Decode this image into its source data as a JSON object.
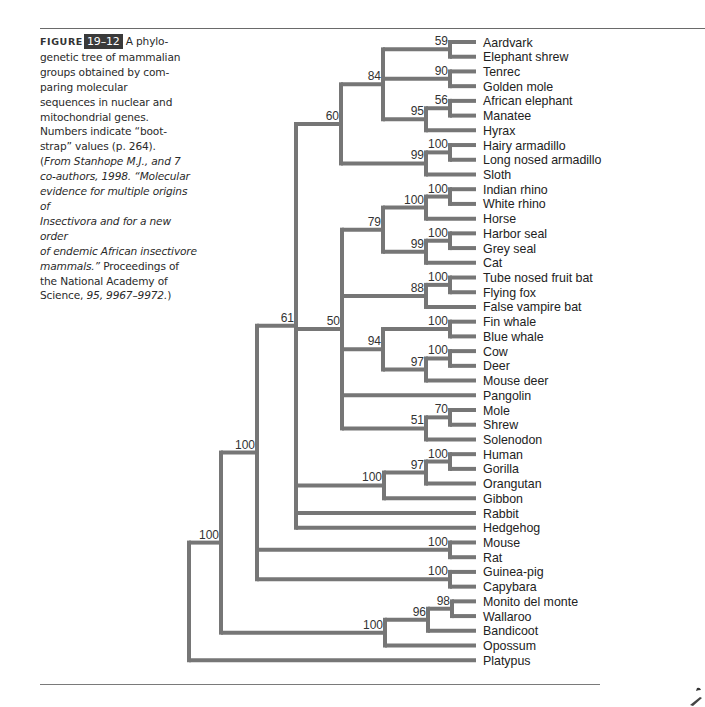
{
  "figure": {
    "label_word": "FIGURE",
    "number": "19–12",
    "caption_text": "A phylogenetic tree of mammalian groups obtained by comparing molecular sequences in nuclear and mitochondrial genes. Numbers indicate “bootstrap” values (p. 264).",
    "caption_lines": [
      "A phylo-",
      "genetic tree of mammalian",
      "groups obtained by com-",
      "paring molecular",
      "sequences in nuclear and",
      "mitochondrial genes.",
      "Numbers indicate “boot-",
      "strap” values (p. 264)."
    ],
    "source_open": "(",
    "source_italic_1": "From Stanhope M.J., and 7",
    "source_italic_2": "co-authors, 1998. “Molecular",
    "source_italic_3": "evidence for multiple origins of",
    "source_italic_4": "Insectivora and for a new order",
    "source_italic_5": "of endemic African insectivore",
    "source_italic_6": "mammals.”",
    "source_plain_1": " Proceedings of",
    "source_plain_2": "the National Academy of",
    "source_plain_3": "Science, ",
    "source_italic_7": "95, 9967–9972.",
    "source_close": ")"
  },
  "colors": {
    "branch": "#767676",
    "rule": "#6a6a6a",
    "figure_badge_bg": "#3a3a3a",
    "text": "#222222"
  },
  "chart_data": {
    "type": "tree",
    "values_meaning": "bootstrap support values",
    "layout": {
      "leaf_top_y": 42,
      "leaf_spacing": 14.72,
      "leaf_x": 476,
      "label_x": 483
    },
    "leaves": [
      "Aardvark",
      "Elephant shrew",
      "Tenrec",
      "Golden mole",
      "African elephant",
      "Manatee",
      "Hyrax",
      "Hairy armadillo",
      "Long nosed armadillo",
      "Sloth",
      "Indian rhino",
      "White rhino",
      "Horse",
      "Harbor seal",
      "Grey seal",
      "Cat",
      "Tube nosed fruit bat",
      "Flying fox",
      "False vampire bat",
      "Fin whale",
      "Blue whale",
      "Cow",
      "Deer",
      "Mouse deer",
      "Pangolin",
      "Mole",
      "Shrew",
      "Solenodon",
      "Human",
      "Gorilla",
      "Orangutan",
      "Gibbon",
      "Rabbit",
      "Hedgehog",
      "Mouse",
      "Rat",
      "Guinea-pig",
      "Capybara",
      "Monito del monte",
      "Wallaroo",
      "Bandicoot",
      "Opossum",
      "Platypus"
    ],
    "tree": {
      "x": 189,
      "support": null,
      "children": [
        {
          "x": 221,
          "support": 100,
          "children": [
            {
              "x": 257,
              "support": 100,
              "children": [
                {
                  "x": 296,
                  "support": 61,
                  "children": [
                    {
                      "x": 341,
                      "support": 60,
                      "children": [
                        {
                          "x": 383,
                          "support": 84,
                          "children": [
                            {
                              "x": 450,
                              "support": 59,
                              "children": [
                                {
                                  "leaf": 0
                                },
                                {
                                  "leaf": 1
                                }
                              ]
                            },
                            {
                              "x": 450,
                              "support": 90,
                              "children": [
                                {
                                  "leaf": 2
                                },
                                {
                                  "leaf": 3
                                }
                              ]
                            },
                            {
                              "x": 426,
                              "support": 95,
                              "children": [
                                {
                                  "x": 450,
                                  "support": 56,
                                  "children": [
                                    {
                                      "leaf": 4
                                    },
                                    {
                                      "leaf": 5
                                    }
                                  ]
                                },
                                {
                                  "leaf": 6
                                }
                              ]
                            }
                          ]
                        },
                        {
                          "x": 426,
                          "support": 99,
                          "children": [
                            {
                              "x": 450,
                              "support": 100,
                              "children": [
                                {
                                  "leaf": 7
                                },
                                {
                                  "leaf": 8
                                }
                              ]
                            },
                            {
                              "leaf": 9
                            }
                          ]
                        }
                      ]
                    },
                    {
                      "x": 342,
                      "support": 50,
                      "children": [
                        {
                          "x": 383,
                          "support": 79,
                          "children": [
                            {
                              "x": 426,
                              "support": 100,
                              "children": [
                                {
                                  "x": 450,
                                  "support": 100,
                                  "children": [
                                    {
                                      "leaf": 10
                                    },
                                    {
                                      "leaf": 11
                                    }
                                  ]
                                },
                                {
                                  "leaf": 12
                                }
                              ]
                            },
                            {
                              "x": 426,
                              "support": 99,
                              "children": [
                                {
                                  "x": 450,
                                  "support": 100,
                                  "children": [
                                    {
                                      "leaf": 13
                                    },
                                    {
                                      "leaf": 14
                                    }
                                  ]
                                },
                                {
                                  "leaf": 15
                                }
                              ]
                            }
                          ]
                        },
                        {
                          "x": 426,
                          "support": 88,
                          "children": [
                            {
                              "x": 450,
                              "support": 100,
                              "children": [
                                {
                                  "leaf": 16
                                },
                                {
                                  "leaf": 17
                                }
                              ]
                            },
                            {
                              "leaf": 18
                            }
                          ]
                        },
                        {
                          "x": 383,
                          "support": 94,
                          "children": [
                            {
                              "x": 450,
                              "support": 100,
                              "children": [
                                {
                                  "leaf": 19
                                },
                                {
                                  "leaf": 20
                                }
                              ]
                            },
                            {
                              "x": 426,
                              "support": 97,
                              "children": [
                                {
                                  "x": 450,
                                  "support": 100,
                                  "children": [
                                    {
                                      "leaf": 21
                                    },
                                    {
                                      "leaf": 22
                                    }
                                  ]
                                },
                                {
                                  "leaf": 23
                                }
                              ]
                            }
                          ]
                        },
                        {
                          "leaf": 24
                        },
                        {
                          "x": 426,
                          "support": 51,
                          "children": [
                            {
                              "x": 450,
                              "support": 70,
                              "children": [
                                {
                                  "leaf": 25
                                },
                                {
                                  "leaf": 26
                                }
                              ]
                            },
                            {
                              "leaf": 27
                            }
                          ]
                        }
                      ]
                    },
                    {
                      "x": 384,
                      "support": 100,
                      "children": [
                        {
                          "x": 426,
                          "support": 97,
                          "children": [
                            {
                              "x": 450,
                              "support": 100,
                              "children": [
                                {
                                  "leaf": 28
                                },
                                {
                                  "leaf": 29
                                }
                              ]
                            },
                            {
                              "leaf": 30
                            }
                          ]
                        },
                        {
                          "leaf": 31
                        }
                      ]
                    },
                    {
                      "leaf": 32
                    },
                    {
                      "leaf": 33
                    }
                  ]
                },
                {
                  "x": 450,
                  "support": 100,
                  "children": [
                    {
                      "leaf": 34
                    },
                    {
                      "leaf": 35
                    }
                  ]
                },
                {
                  "x": 450,
                  "support": 100,
                  "children": [
                    {
                      "leaf": 36
                    },
                    {
                      "leaf": 37
                    }
                  ]
                }
              ]
            },
            {
              "x": 385,
              "support": 100,
              "children": [
                {
                  "x": 428,
                  "support": 96,
                  "children": [
                    {
                      "x": 452,
                      "support": 98,
                      "children": [
                        {
                          "leaf": 38
                        },
                        {
                          "leaf": 39
                        }
                      ]
                    },
                    {
                      "leaf": 40
                    }
                  ]
                },
                {
                  "leaf": 41
                }
              ]
            }
          ]
        },
        {
          "leaf": 42
        }
      ]
    }
  }
}
